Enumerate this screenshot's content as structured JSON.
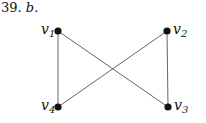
{
  "problem": {
    "number": "39.",
    "part": "b."
  },
  "graph": {
    "vertices": [
      {
        "id": "v1",
        "base": "v",
        "sub": "1",
        "x": 58,
        "y": 31,
        "label_side": "left"
      },
      {
        "id": "v2",
        "base": "v",
        "sub": "2",
        "x": 167,
        "y": 31,
        "label_side": "right"
      },
      {
        "id": "v3",
        "base": "v",
        "sub": "3",
        "x": 168,
        "y": 107,
        "label_side": "right"
      },
      {
        "id": "v4",
        "base": "v",
        "sub": "4",
        "x": 58,
        "y": 107,
        "label_side": "left"
      }
    ],
    "edges": [
      [
        "v1",
        "v4"
      ],
      [
        "v1",
        "v3"
      ],
      [
        "v2",
        "v4"
      ],
      [
        "v2",
        "v3"
      ]
    ],
    "colors": {
      "edge": "#555555",
      "vertex": "#111111"
    }
  }
}
